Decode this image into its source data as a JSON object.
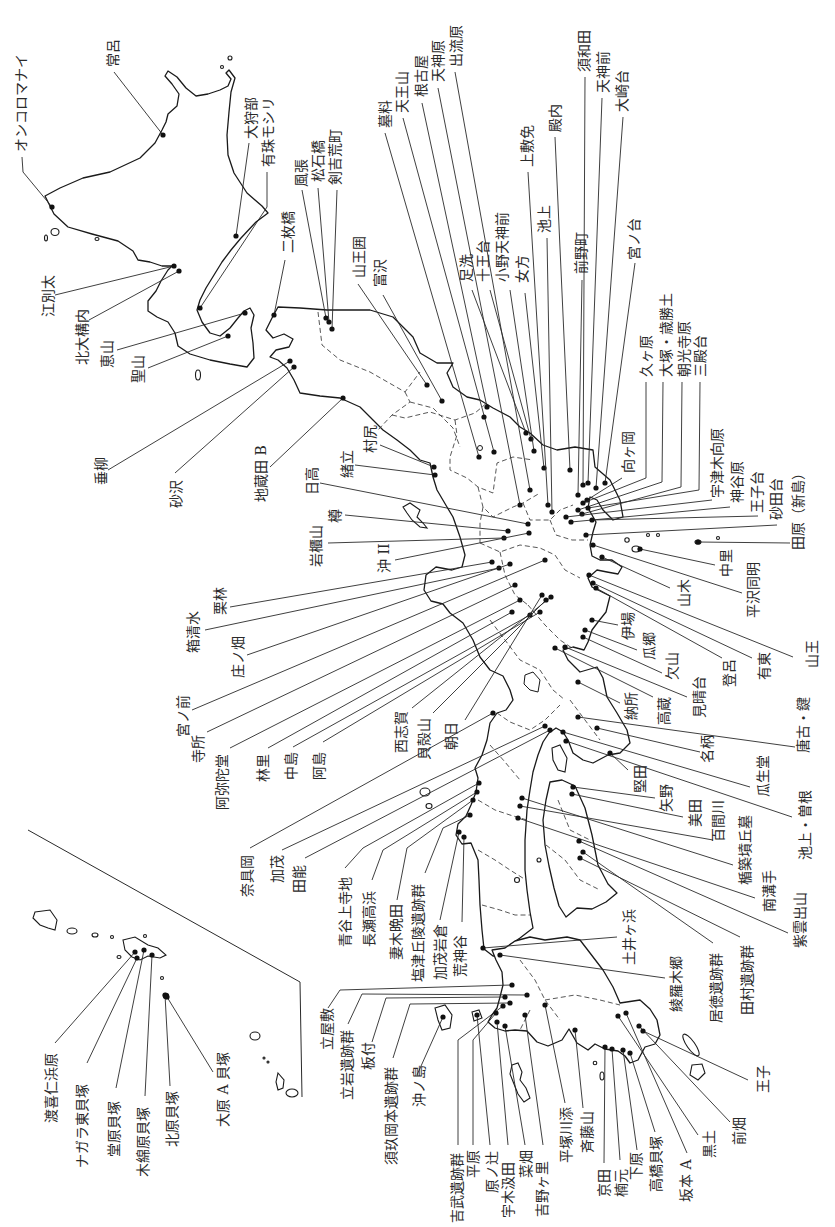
{
  "sites": {
    "hokkaido": [
      "オンコロマナイ",
      "常呂",
      "大狩部",
      "有珠モシリ",
      "江別太",
      "北大構内",
      "恵山",
      "聖山"
    ],
    "tohoku": [
      "垂柳",
      "砂沢",
      "地蔵田 B",
      "二枚橋",
      "風張",
      "松石橋",
      "剣吉荒町",
      "山王囲",
      "富沢",
      "墓料",
      "天王山",
      "根古屋",
      "村尻",
      "緒立"
    ],
    "kanto": [
      "天神原",
      "出流原",
      "足洗",
      "十王台",
      "小野天神前",
      "女方",
      "上敷免",
      "池上",
      "殿内",
      "前野町",
      "須和田",
      "天神前",
      "大崎台",
      "宮ノ台",
      "向ヶ岡",
      "久ヶ原",
      "大塚・歳勝土",
      "朝光寺原",
      "三殿台",
      "宇津木向原",
      "神谷原",
      "王子台",
      "砂田台",
      "田原（新島）",
      "中里",
      "平沢同明",
      "日高",
      "樽",
      "岩櫃山",
      "沖 II"
    ],
    "chubu": [
      "山木",
      "山王",
      "有東",
      "登呂",
      "伊場",
      "瓜郷",
      "欠山",
      "見晴台",
      "高蔵",
      "栗林",
      "箱清水",
      "庄ノ畑",
      "宮ノ前",
      "寺所",
      "阿弥陀堂",
      "林里",
      "中島",
      "阿島",
      "西志賀",
      "貝殻山",
      "朝日"
    ],
    "kinki": [
      "納所",
      "唐古・鍵",
      "名柄",
      "瓜生堂",
      "池上・曽根",
      "堅田",
      "奈具岡",
      "加茂",
      "田能"
    ],
    "chugoku_shikoku": [
      "矢野",
      "美田",
      "百間川",
      "楯築墳丘墓",
      "南溝手",
      "紫雲出山",
      "居徳遺跡群",
      "田村遺跡群",
      "土井ヶ浜",
      "綾羅木郷",
      "青谷上寺地",
      "長瀬高浜",
      "妻木晩田",
      "塩津丘陵遺跡群",
      "加茂岩倉",
      "荒神谷"
    ],
    "kyushu": [
      "立屋敷",
      "立岩遺跡群",
      "板付",
      "須玖岡本遺跡群",
      "沖ノ島",
      "吉武遺跡群",
      "平原",
      "原ノ辻",
      "宇木汲田",
      "菜畑",
      "吉野ヶ里",
      "平塚川添",
      "斉藤山",
      "京田",
      "楠元",
      "下原",
      "高橋貝塚",
      "坂本 A",
      "黒土",
      "前畑",
      "王子"
    ],
    "okinawa": [
      "渡喜仁浜原",
      "ナガラ東貝塚",
      "堂原貝塚",
      "木綿原貝塚",
      "北原貝塚",
      "大原 A 貝塚"
    ]
  },
  "colors": {
    "ink": "#1a1a1a",
    "background": "#ffffff"
  }
}
